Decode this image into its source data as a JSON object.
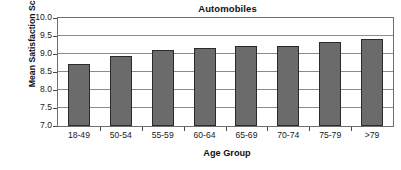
{
  "chart_data": {
    "type": "bar",
    "title": "Automobiles",
    "xlabel": "Age Group",
    "ylabel": "Mean Satisfaction Score",
    "categories": [
      "18-49",
      "50-54",
      "55-59",
      "60-64",
      "65-69",
      "70-74",
      "75-79",
      ">79"
    ],
    "values": [
      8.73,
      8.94,
      9.12,
      9.17,
      9.22,
      9.22,
      9.34,
      9.41
    ],
    "ylim": [
      7.0,
      10.0
    ],
    "ytick_labels": [
      "10.0",
      "9.5",
      "9.0",
      "8.5",
      "8.0",
      "7.5",
      "7.0"
    ],
    "ytick_values": [
      10.0,
      9.5,
      9.0,
      8.5,
      8.0,
      7.5,
      7.0
    ],
    "grid": true,
    "legend": "none",
    "bar_color": "#6b6b6b",
    "bar_edge_color": "#2a2a2a",
    "plot_background": "#ffffff",
    "gridline_color": "#8a8a8a",
    "frame_color": "#6e6e6e"
  }
}
